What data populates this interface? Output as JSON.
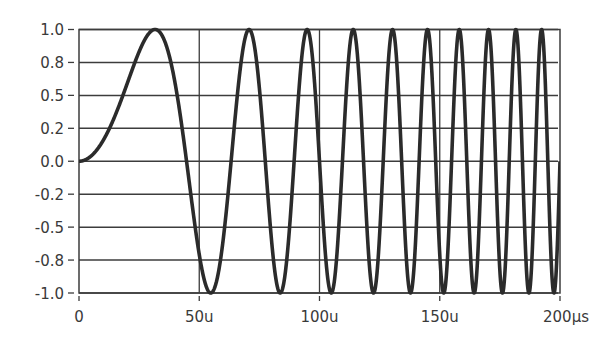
{
  "chart_data": {
    "type": "line",
    "title": "",
    "xlabel": "",
    "ylabel": "",
    "xlim": [
      0,
      200
    ],
    "ylim": [
      -1.0,
      1.0
    ],
    "grid": true,
    "legend": null,
    "x_unit": "µs",
    "x_ticks": [
      0,
      50,
      100,
      150,
      200
    ],
    "x_tick_labels": [
      "0",
      "50u",
      "100u",
      "150u",
      "200µs"
    ],
    "y_ticks": [
      1.0,
      0.75,
      0.5,
      0.25,
      0.0,
      -0.25,
      -0.5,
      -0.75,
      -1.0
    ],
    "y_tick_labels": [
      "1.0",
      "0.8",
      "0.5",
      "0.2",
      "0.0",
      "-0.2",
      "-0.5",
      "-0.8",
      "-1.0"
    ],
    "series": [
      {
        "name": "chirp",
        "description": "Linear chirp y = sin(pi * t^2 / 2000), t in µs; 10 peaks between 0 and 200µs",
        "formula_k_rad_per_us2": 0.0015708,
        "color": "#2b2b2b",
        "peaks_t_us": [
          31.6,
          70.7,
          94.9,
          114.0,
          130.4,
          144.9,
          158.1,
          170.3,
          181.7,
          192.4
        ],
        "troughs_t_us": [
          54.8,
          83.7,
          104.9,
          122.5,
          137.8,
          151.7,
          164.3,
          176.1,
          187.1,
          197.5
        ],
        "x": [
          0,
          10,
          20,
          31.6,
          40,
          50,
          54.8,
          60,
          70.7,
          83.7,
          94.9,
          104.9,
          114.0,
          122.5,
          130.4,
          137.8,
          144.9,
          151.7,
          158.1,
          164.3,
          170.3,
          176.1,
          181.7,
          187.1,
          192.4,
          197.5,
          200
        ],
        "values": [
          0,
          0.16,
          0.59,
          1.0,
          0.59,
          -0.71,
          -1.0,
          -0.81,
          1.0,
          -1.0,
          1.0,
          -1.0,
          1.0,
          -1.0,
          1.0,
          -1.0,
          1.0,
          -1.0,
          1.0,
          -1.0,
          1.0,
          -1.0,
          1.0,
          -1.0,
          1.0,
          -1.0,
          0.0
        ]
      }
    ]
  },
  "colors": {
    "curve": "#2b2b2b",
    "grid": "#3c3c3c",
    "axis": "#3c3c3c",
    "text": "#3a3a3a",
    "background": "#ffffff"
  }
}
